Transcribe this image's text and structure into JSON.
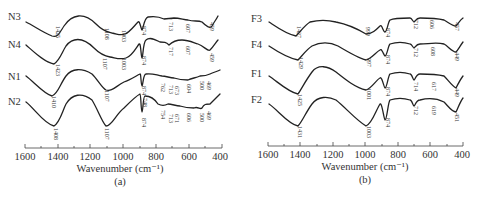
{
  "chart_data": [
    {
      "type": "line",
      "panel": "(a)",
      "title": "",
      "xlabel": "Wavenumber (cm⁻¹)",
      "ylabel": "",
      "xlim": [
        1600,
        400
      ],
      "x_reversed": true,
      "xticks": [
        1600,
        1400,
        1200,
        1000,
        800,
        600,
        400
      ],
      "grid": false,
      "legend": "inline labels at left of each curve",
      "series": [
        {
          "name": "N3",
          "peaks": [
            1425,
            1108,
            1003,
            874,
            713,
            607,
            459
          ]
        },
        {
          "name": "N4",
          "peaks": [
            1423,
            1107,
            1003,
            874,
            717,
            607,
            459
          ]
        },
        {
          "name": "N1",
          "peaks": [
            1410,
            1107,
            874,
            762,
            713,
            673,
            604,
            500,
            469
          ]
        },
        {
          "name": "N2",
          "peaks": [
            1408,
            1107,
            874,
            748,
            754,
            713,
            671,
            606,
            500,
            469
          ]
        }
      ]
    },
    {
      "type": "line",
      "panel": "(b)",
      "title": "",
      "xlabel": "Wavenumber (cm⁻¹)",
      "ylabel": "",
      "xlim": [
        1600,
        400
      ],
      "x_reversed": true,
      "xticks": [
        1600,
        1400,
        1200,
        1000,
        800,
        600,
        400
      ],
      "grid": false,
      "legend": "inline labels at left of each curve",
      "series": [
        {
          "name": "F3",
          "peaks": [
            1427,
            999,
            874,
            712,
            606,
            457
          ]
        },
        {
          "name": "F4",
          "peaks": [
            1429,
            997,
            874,
            712,
            608,
            449
          ]
        },
        {
          "name": "F1",
          "peaks": [
            1425,
            1001,
            874,
            714,
            617,
            449
          ]
        },
        {
          "name": "F2",
          "peaks": [
            1431,
            1003,
            874,
            712,
            619,
            451
          ]
        }
      ]
    }
  ],
  "panels": {
    "a": {
      "label": "(a)",
      "xlabel": "Wavenumber (cm⁻¹)",
      "ticks": [
        "1600",
        "1400",
        "1200",
        "1000",
        "800",
        "600",
        "400"
      ],
      "series_labels": [
        "N3",
        "N4",
        "N1",
        "N2"
      ]
    },
    "b": {
      "label": "(b)",
      "xlabel": "Wavenumber (cm⁻¹)",
      "ticks": [
        "1600",
        "1400",
        "1200",
        "1000",
        "800",
        "600",
        "400"
      ],
      "series_labels": [
        "F3",
        "F4",
        "F1",
        "F2"
      ]
    }
  },
  "peak_labels": {
    "a": [
      {
        "text": "1425",
        "x": 56,
        "y": 26
      },
      {
        "text": "1108",
        "x": 105,
        "y": 28
      },
      {
        "text": "1003",
        "x": 122,
        "y": 30
      },
      {
        "text": "874",
        "x": 142,
        "y": 26
      },
      {
        "text": "713",
        "x": 169,
        "y": 22
      },
      {
        "text": "607",
        "x": 186,
        "y": 24
      },
      {
        "text": "459",
        "x": 210,
        "y": 22
      },
      {
        "text": "1423",
        "x": 56,
        "y": 64
      },
      {
        "text": "1107",
        "x": 103,
        "y": 58
      },
      {
        "text": "1003",
        "x": 122,
        "y": 58
      },
      {
        "text": "874",
        "x": 142,
        "y": 56
      },
      {
        "text": "717",
        "x": 169,
        "y": 47
      },
      {
        "text": "607",
        "x": 186,
        "y": 46
      },
      {
        "text": "459",
        "x": 210,
        "y": 53
      },
      {
        "text": "1410",
        "x": 52,
        "y": 96
      },
      {
        "text": "1107",
        "x": 105,
        "y": 90
      },
      {
        "text": "874",
        "x": 142,
        "y": 86
      },
      {
        "text": "762",
        "x": 161,
        "y": 83
      },
      {
        "text": "713",
        "x": 169,
        "y": 85
      },
      {
        "text": "673",
        "x": 175,
        "y": 86
      },
      {
        "text": "604",
        "x": 187,
        "y": 84
      },
      {
        "text": "500",
        "x": 200,
        "y": 81
      },
      {
        "text": "469",
        "x": 207,
        "y": 81
      },
      {
        "text": "1408",
        "x": 54,
        "y": 128
      },
      {
        "text": "1107",
        "x": 105,
        "y": 128
      },
      {
        "text": "748",
        "x": 143,
        "y": 98
      },
      {
        "text": "874",
        "x": 142,
        "y": 118
      },
      {
        "text": "754",
        "x": 161,
        "y": 110
      },
      {
        "text": "713",
        "x": 169,
        "y": 114
      },
      {
        "text": "671",
        "x": 175,
        "y": 114
      },
      {
        "text": "606",
        "x": 187,
        "y": 113
      },
      {
        "text": "500",
        "x": 200,
        "y": 113
      },
      {
        "text": "469",
        "x": 207,
        "y": 111
      }
    ],
    "b": [
      {
        "text": "1427",
        "x": 297,
        "y": 26
      },
      {
        "text": "999",
        "x": 366,
        "y": 27
      },
      {
        "text": "874",
        "x": 386,
        "y": 28
      },
      {
        "text": "712",
        "x": 414,
        "y": 20
      },
      {
        "text": "606",
        "x": 430,
        "y": 20
      },
      {
        "text": "457",
        "x": 455,
        "y": 22
      },
      {
        "text": "1429",
        "x": 299,
        "y": 57
      },
      {
        "text": "997",
        "x": 367,
        "y": 58
      },
      {
        "text": "874",
        "x": 386,
        "y": 55
      },
      {
        "text": "712",
        "x": 414,
        "y": 48
      },
      {
        "text": "608",
        "x": 431,
        "y": 47
      },
      {
        "text": "449",
        "x": 455,
        "y": 52
      },
      {
        "text": "1425",
        "x": 298,
        "y": 94
      },
      {
        "text": "1001",
        "x": 367,
        "y": 88
      },
      {
        "text": "874",
        "x": 386,
        "y": 87
      },
      {
        "text": "714",
        "x": 414,
        "y": 82
      },
      {
        "text": "617",
        "x": 432,
        "y": 82
      },
      {
        "text": "449",
        "x": 455,
        "y": 88
      },
      {
        "text": "1431",
        "x": 298,
        "y": 126
      },
      {
        "text": "1003",
        "x": 367,
        "y": 126
      },
      {
        "text": "874",
        "x": 386,
        "y": 118
      },
      {
        "text": "712",
        "x": 414,
        "y": 106
      },
      {
        "text": "619",
        "x": 432,
        "y": 106
      },
      {
        "text": "451",
        "x": 455,
        "y": 113
      }
    ]
  },
  "curves": {
    "a": [
      {
        "name": "N3",
        "label_x": 8,
        "label_y": 20,
        "path": "M26,22 C34,26 42,32 52,36 C58,38 60,32 64,26 C72,14 84,12 96,24 C104,32 108,32 112,33 C118,34 120,36 125,34 C130,32 134,26 138,22 C140,20 141,30 142,30 C143,30 144,18 148,17 C154,16 158,16 164,19 C168,18 170,19 174,18 C180,18 184,20 188,20 C194,22 198,20 202,22 C206,26 210,29 212,26 C214,22 216,20 218,16"
      },
      {
        "name": "N4",
        "label_x": 8,
        "label_y": 45,
        "path": "M26,45 C34,52 44,62 54,64 C60,60 62,52 66,46 C72,38 82,36 94,48 C100,54 104,56 110,57 C116,58 120,60 126,58 C132,56 136,48 139,44 C141,42 141,58 142,58 C143,58 143,42 146,40 C150,36 156,40 160,42 C164,42 166,42 169,45 C172,42 176,40 182,40 C188,40 192,42 198,44 C204,46 208,52 210,50 C214,46 216,42 218,40"
      },
      {
        "name": "N1",
        "label_x": 8,
        "label_y": 77,
        "path": "M26,76 C34,82 44,94 52,96 C58,94 60,84 66,76 C72,68 82,68 92,74 C98,80 102,88 106,90 C112,92 116,86 124,82 C130,80 136,76 140,74 C141,73 141,86 142,86 C143,86 143,74 146,74 C152,73 156,75 162,76 C166,76 170,78 174,78 C180,80 184,80 188,80 C192,78 196,78 200,76 C204,76 206,76 210,74 C214,72 216,72 220,70"
      },
      {
        "name": "N2",
        "label_x": 8,
        "label_y": 100,
        "path": "M26,102 C34,108 44,124 54,126 C60,122 62,112 66,104 C72,94 82,92 92,100 C98,110 102,122 106,126 C112,126 116,114 124,108 C130,102 136,96 140,94 C141,94 141,112 142,112 C143,112 143,96 145,96 C150,96 154,98 158,104 C162,106 164,106 168,104 C172,104 176,106 180,106 C186,108 190,108 194,108 C198,106 200,110 202,108 C204,104 206,104 210,104 C214,100 216,98 220,94"
      }
    ],
    "b": [
      {
        "name": "F3",
        "label_x": 250,
        "label_y": 20,
        "path": "M269,22 C278,28 286,34 296,36 C300,32 304,26 310,22 C318,20 328,20 336,22 C346,24 356,28 366,34 C372,34 376,30 380,26 C382,24 383,32 385,32 C387,32 388,22 390,20 C394,18 402,18 410,18 C412,18 413,22 414,22 C415,22 416,18 420,18 C428,18 436,18 444,20 C448,22 452,26 456,26 C458,24 460,20 463,18"
      },
      {
        "name": "F4",
        "label_x": 250,
        "label_y": 45,
        "path": "M269,46 C278,52 288,58 298,60 C302,56 306,50 312,46 C320,42 330,42 338,46 C348,52 358,58 366,60 C372,58 376,52 380,50 C382,48 384,56 385,56 C387,56 388,46 390,44 C396,42 404,42 410,44 C412,44 413,48 414,48 C415,48 416,44 420,44 C428,44 436,42 444,44 C448,46 452,52 456,52 C458,50 460,46 463,42"
      },
      {
        "name": "F1",
        "label_x": 250,
        "label_y": 77,
        "path": "M269,76 C278,82 288,92 298,94 C302,88 306,80 312,72 C318,64 328,66 336,72 C346,80 356,88 366,90 C372,88 376,80 380,78 C382,76 384,88 385,88 C387,88 388,76 390,74 C396,72 404,72 410,74 C412,74 413,80 414,80 C415,80 416,74 420,74 C428,74 436,74 444,76 C448,80 452,86 456,88 C458,84 460,80 463,76"
      },
      {
        "name": "F2",
        "label_x": 250,
        "label_y": 100,
        "path": "M269,104 C278,110 288,124 298,126 C302,122 306,112 312,104 C318,96 328,96 336,100 C346,108 356,120 366,126 C372,124 376,110 380,104 C382,102 384,120 385,120 C387,120 388,102 390,100 C396,98 404,98 410,100 C412,100 413,106 414,106 C415,106 416,100 420,100 C428,98 436,98 444,102 C448,106 452,112 456,112 C458,108 460,102 463,98"
      }
    ]
  }
}
